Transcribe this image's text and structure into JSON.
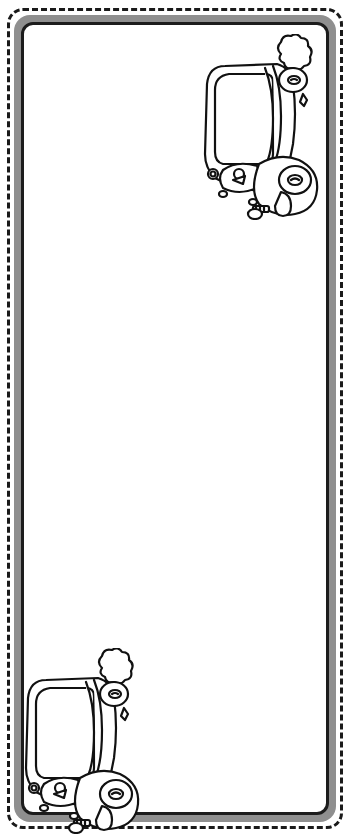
{
  "page": {
    "type": "printable bookmark / coloring page",
    "caption": "Bookmark with cartoon car illustrations"
  },
  "frame": {
    "outer_border_style": "dashed",
    "outer_border_color": "#1a1a1a",
    "frame_color": "#8f8f8f",
    "inner_border_color": "#1c1c1c",
    "background": "#ffffff"
  },
  "illustrations": [
    {
      "name": "car",
      "position": "top-right",
      "orientation": "rotated 90deg, front facing down"
    },
    {
      "name": "car",
      "position": "bottom-left",
      "orientation": "rotated 90deg, front facing down"
    }
  ]
}
